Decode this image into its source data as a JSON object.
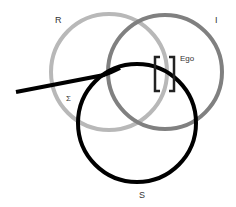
{
  "diagram": {
    "rings": [
      {
        "id": "R",
        "label": "R",
        "color": "#b8b8b8",
        "cx": 109,
        "cy": 72,
        "r": 58
      },
      {
        "id": "I",
        "label": "I",
        "color": "#808080",
        "cx": 165,
        "cy": 72,
        "r": 57
      },
      {
        "id": "S",
        "label": "S",
        "color": "#000000",
        "cx": 137,
        "cy": 123,
        "r": 59
      }
    ],
    "labels": {
      "R": "R",
      "I": "I",
      "S": "S",
      "ego": "Ego",
      "sigma": "Σ"
    },
    "sinthome": {
      "color": "#000000",
      "description": "line joining S ring extending left"
    },
    "ego_brackets": {
      "color": "#222222"
    }
  }
}
